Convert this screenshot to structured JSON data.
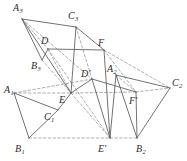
{
  "figure": {
    "width": 187,
    "height": 161,
    "background": "#ffffff",
    "stroke_solid": "#5a5a5a",
    "stroke_dashed": "#8d8d8d",
    "label_color": "#2b2b2b"
  },
  "labels": [
    {
      "id": "A3",
      "base": "A",
      "sub": "3",
      "prime": "",
      "x": 13,
      "y": 3,
      "anchor": "top-left"
    },
    {
      "id": "C3",
      "base": "C",
      "sub": "3",
      "prime": "",
      "x": 68,
      "y": 11,
      "anchor": "top-left"
    },
    {
      "id": "D",
      "base": "D",
      "sub": "",
      "prime": "",
      "x": 41,
      "y": 36,
      "anchor": "top-left"
    },
    {
      "id": "F",
      "base": "F",
      "sub": "",
      "prime": "",
      "x": 98,
      "y": 38,
      "anchor": "top-left"
    },
    {
      "id": "B3",
      "base": "B",
      "sub": "3",
      "prime": "",
      "x": 31,
      "y": 61,
      "anchor": "top-left"
    },
    {
      "id": "Dprime",
      "base": "D",
      "sub": "",
      "prime": "'",
      "x": 81,
      "y": 69,
      "anchor": "top-left"
    },
    {
      "id": "A2",
      "base": "A",
      "sub": "2",
      "prime": "",
      "x": 107,
      "y": 64,
      "anchor": "top-left"
    },
    {
      "id": "A1",
      "base": "A",
      "sub": "1",
      "prime": "",
      "x": 4,
      "y": 85,
      "anchor": "top-left"
    },
    {
      "id": "E",
      "base": "E",
      "sub": "",
      "prime": "",
      "x": 59,
      "y": 95,
      "anchor": "top-left"
    },
    {
      "id": "C2",
      "base": "C",
      "sub": "2",
      "prime": "",
      "x": 172,
      "y": 78,
      "anchor": "top-left"
    },
    {
      "id": "Fprime",
      "base": "F",
      "sub": "",
      "prime": "'",
      "x": 129,
      "y": 96,
      "anchor": "top-left"
    },
    {
      "id": "C1",
      "base": "C",
      "sub": "1",
      "prime": "",
      "x": 44,
      "y": 112,
      "anchor": "top-left"
    },
    {
      "id": "B1",
      "base": "B",
      "sub": "1",
      "prime": "",
      "x": 15,
      "y": 144,
      "anchor": "top-left"
    },
    {
      "id": "Eprime",
      "base": "E",
      "sub": "",
      "prime": "'",
      "x": 98,
      "y": 144,
      "anchor": "top-left"
    },
    {
      "id": "B2",
      "base": "B",
      "sub": "2",
      "prime": "",
      "x": 136,
      "y": 144,
      "anchor": "top-left"
    }
  ],
  "points": {
    "A3": [
      22,
      19
    ],
    "C3": [
      76,
      27
    ],
    "B3": [
      42,
      60
    ],
    "D": [
      48,
      49
    ],
    "F": [
      104,
      50
    ],
    "E": [
      71,
      93
    ],
    "Dprime": [
      92,
      79
    ],
    "A2": [
      116,
      75
    ],
    "C2": [
      170,
      88
    ],
    "Fprime": [
      136,
      92
    ],
    "Eprime": [
      110,
      138
    ],
    "B2": [
      137,
      138
    ],
    "A1": [
      14,
      93
    ],
    "C1": [
      58,
      110
    ],
    "B1": [
      29,
      138
    ]
  },
  "segments_solid": [
    {
      "name": "A3-C3",
      "from": "A3",
      "to": "C3"
    },
    {
      "name": "A3-B3",
      "from": "A3",
      "to": "B3"
    },
    {
      "name": "A3-E",
      "from": "A3",
      "to": "E"
    },
    {
      "name": "C3-E",
      "from": "C3",
      "to": "E"
    },
    {
      "name": "D-F",
      "from": "D",
      "to": "F"
    },
    {
      "name": "D-B3",
      "from": "D",
      "to": "B3"
    },
    {
      "name": "C3-F",
      "from": "C3",
      "to": "F"
    },
    {
      "name": "F-Eprime",
      "from": "F",
      "to": "Eprime"
    },
    {
      "name": "Dprime-Fprime",
      "from": "Dprime",
      "to": "Fprime"
    },
    {
      "name": "E-Dprime",
      "from": "E",
      "to": "Dprime"
    },
    {
      "name": "Dprime-Eprime",
      "from": "Dprime",
      "to": "Eprime"
    },
    {
      "name": "A2-C2",
      "from": "A2",
      "to": "C2"
    },
    {
      "name": "A2-Eprime",
      "from": "A2",
      "to": "Eprime"
    },
    {
      "name": "C2-B2",
      "from": "C2",
      "to": "B2"
    },
    {
      "name": "A2-B2",
      "from": "A2",
      "to": "B2"
    },
    {
      "name": "A1-C1",
      "from": "A1",
      "to": "C1"
    },
    {
      "name": "A1-B1",
      "from": "A1",
      "to": "B1"
    },
    {
      "name": "B1-C1",
      "from": "B1",
      "to": "C1"
    },
    {
      "name": "E-C1",
      "from": "E",
      "to": "C1"
    },
    {
      "name": "Fprime-B2",
      "from": "Fprime",
      "to": "B2"
    }
  ],
  "segments_dashed": [
    {
      "name": "A3-Dprime",
      "from": "A3",
      "to": "Dprime"
    },
    {
      "name": "A3-D",
      "from": "A3",
      "to": "D"
    },
    {
      "name": "B3-E",
      "from": "B3",
      "to": "E"
    },
    {
      "name": "C3-Dprime",
      "from": "C3",
      "to": "Dprime"
    },
    {
      "name": "D-E",
      "from": "D",
      "to": "E"
    },
    {
      "name": "D-Eprime",
      "from": "D",
      "to": "Eprime"
    },
    {
      "name": "F-Fprime",
      "from": "F",
      "to": "Fprime"
    },
    {
      "name": "F-C2",
      "from": "F",
      "to": "C2"
    },
    {
      "name": "A1-E",
      "from": "A1",
      "to": "E"
    },
    {
      "name": "E-Fprime",
      "from": "E",
      "to": "Fprime"
    },
    {
      "name": "Fprime-C2",
      "from": "Fprime",
      "to": "C2"
    },
    {
      "name": "A1-Dprime",
      "from": "A1",
      "to": "Dprime"
    },
    {
      "name": "B1-Eprime",
      "from": "B1",
      "to": "Eprime"
    },
    {
      "name": "Eprime-B2",
      "from": "Eprime",
      "to": "B2"
    },
    {
      "name": "E-Eprime",
      "from": "E",
      "to": "Eprime"
    },
    {
      "name": "A2-Fprime",
      "from": "A2",
      "to": "Fprime"
    }
  ]
}
